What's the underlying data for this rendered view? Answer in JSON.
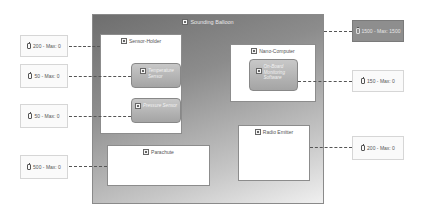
{
  "outer": {
    "title": "Sounding Balloon",
    "icon": "component-icon"
  },
  "boxes": {
    "sensor_holder": {
      "title": "Sensor-Holder"
    },
    "nano_computer": {
      "title": "Nano-Computer"
    },
    "parachute": {
      "title": "Parachute"
    },
    "radio_emitter": {
      "title": "Radio Emitter"
    }
  },
  "components": {
    "temperature_sensor": {
      "label": "Temperature Sensor"
    },
    "pressure_sensor": {
      "label": "Pressure Sensor"
    },
    "monitoring_software": {
      "label": "On-Board Monitoring Software"
    }
  },
  "tags": {
    "balloon": "1500 - Max: 1500",
    "sensor_holder": "200 - Max: 0",
    "temperature_sensor": "50 - Max: 0",
    "pressure_sensor": "50 - Max: 0",
    "parachute": "500 - Max: 0",
    "nano_computer": "150 - Max: 0",
    "radio_emitter": "200 - Max: 0"
  }
}
